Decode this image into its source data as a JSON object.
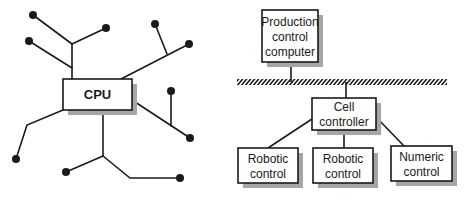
{
  "left_diagram": {
    "title": "Centralized (star) architecture",
    "central_node": {
      "label": "CPU"
    },
    "terminal_count": 11
  },
  "right_diagram": {
    "title": "Hierarchical architecture",
    "top": {
      "line1": "Production",
      "line2": "control",
      "line3": "computer"
    },
    "bus": {
      "label": "network bus"
    },
    "middle": {
      "line1": "Cell",
      "line2": "controller"
    },
    "leaves": [
      {
        "line1": "Robotic",
        "line2": "control"
      },
      {
        "line1": "Robotic",
        "line2": "control"
      },
      {
        "line1": "Numeric",
        "line2": "control"
      }
    ]
  },
  "colors": {
    "line": "#1a1a1a",
    "shadow": "#a6a6a6",
    "box_fill": "#ffffff"
  }
}
